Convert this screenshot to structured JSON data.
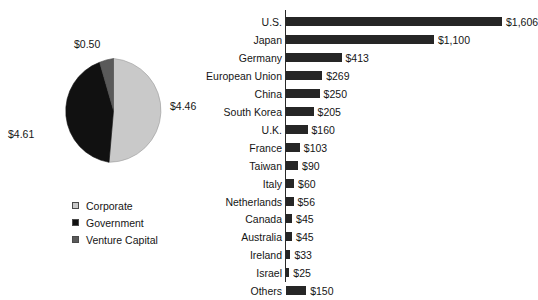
{
  "chart_data": [
    {
      "type": "pie",
      "title": "",
      "unit": "$ billions",
      "legend_position": "below",
      "labels": [
        "Corporate",
        "Government",
        "Venture Capital"
      ],
      "values": [
        4.46,
        4.61,
        0.5
      ],
      "value_labels": [
        "$4.46",
        "$4.61",
        "$0.50"
      ],
      "colors": [
        "#c9c9c9",
        "#111111",
        "#5a5a5a"
      ],
      "slice_order": [
        "Corporate",
        "Government",
        "Venture Capital"
      ],
      "start_angle_deg": 0
    },
    {
      "type": "bar",
      "orientation": "horizontal",
      "title": "",
      "xlabel": "",
      "ylabel": "",
      "grid": false,
      "legend_position": "none",
      "bar_color": "#262626",
      "xlim": [
        0,
        1606
      ],
      "categories": [
        "U.S.",
        "Japan",
        "Germany",
        "European Union",
        "China",
        "South Korea",
        "U.K.",
        "France",
        "Taiwan",
        "Italy",
        "Netherlands",
        "Canada",
        "Australia",
        "Ireland",
        "Israel",
        "Others"
      ],
      "values": [
        1606,
        1100,
        413,
        269,
        250,
        205,
        160,
        103,
        90,
        60,
        56,
        45,
        45,
        33,
        25,
        150
      ],
      "data_labels": [
        "$1,606",
        "$1,100",
        "$413",
        "$269",
        "$250",
        "$205",
        "$160",
        "$103",
        "$90",
        "$60",
        "$56",
        "$45",
        "$45",
        "$33",
        "$25",
        "$150"
      ]
    }
  ],
  "pie": {
    "label_corporate": "$4.46",
    "label_government": "$4.61",
    "label_venture": "$0.50",
    "legend": [
      {
        "label": "Corporate",
        "color": "#c9c9c9"
      },
      {
        "label": "Government",
        "color": "#111111"
      },
      {
        "label": "Venture Capital",
        "color": "#5a5a5a"
      }
    ]
  }
}
